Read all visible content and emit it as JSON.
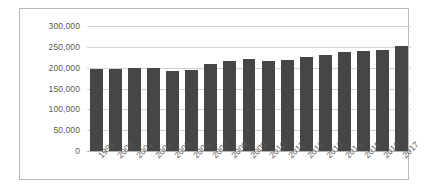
{
  "chart_data": {
    "type": "bar",
    "title": "",
    "xlabel": "",
    "ylabel": "",
    "ylim": [
      0,
      300000
    ],
    "ytick_step": 50000,
    "ytick_labels": [
      "300,000",
      "250,000",
      "200,000",
      "150,000",
      "100,000",
      "50,000",
      "0"
    ],
    "ytick_values": [
      300000,
      250000,
      200000,
      150000,
      100000,
      50000,
      0
    ],
    "grid": true,
    "legend": false,
    "bar_color": "#464646",
    "gridline_color": "#d2d2d2",
    "border_color": "#b9b9b9",
    "label_color": "#59595b",
    "categories": [
      "1999",
      "2000",
      "2001",
      "2004",
      "2005",
      "2006",
      "2007",
      "2008",
      "2009",
      "2010",
      "2011",
      "2012",
      "2013",
      "2014",
      "2015",
      "2016",
      "2017"
    ],
    "values": [
      196000,
      196000,
      199000,
      199000,
      193000,
      194000,
      210000,
      216000,
      220000,
      216000,
      218000,
      225000,
      231000,
      238000,
      240000,
      243000,
      252000
    ]
  }
}
